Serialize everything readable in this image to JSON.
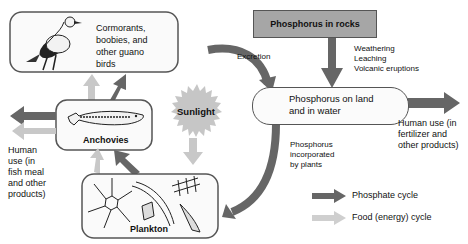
{
  "nodes": {
    "birds": {
      "label": "Cormorants,\nboobies, and\nother guano\nbirds",
      "lines": [
        "Cormorants,",
        "boobies, and",
        "other guano",
        "birds"
      ]
    },
    "rocks": {
      "label": "Phosphorus in rocks"
    },
    "land_water": {
      "lines": [
        "Phosphorus on land",
        "and in water"
      ]
    },
    "anchovies": {
      "label": "Anchovies"
    },
    "sunlight": {
      "label": "Sunlight"
    },
    "plankton": {
      "label": "Plankton"
    }
  },
  "edge_labels": {
    "excretion": "Excretion",
    "weathering": [
      "Weathering",
      "Leaching",
      "Volcanic eruptions"
    ],
    "human_use_fertilizer": [
      "Human use (in",
      "fertilizer and",
      "other products)"
    ],
    "human_use_fishmeal": [
      "Human",
      "use (in",
      "fish meal",
      "and other",
      "products)"
    ],
    "incorporated": [
      "Phosphorus",
      "incorporated",
      "by plants"
    ]
  },
  "legend": {
    "items": [
      {
        "label": "Phosphate cycle",
        "color": "#666666"
      },
      {
        "label": "Food (energy) cycle",
        "color": "#c8c8c8"
      }
    ]
  },
  "colors": {
    "phosphate_arrow": "#666666",
    "food_arrow": "#c8c8c8",
    "rock_box": "#a6a6a6",
    "sunlight": "#c4c4c4",
    "box_border": "#555555"
  }
}
